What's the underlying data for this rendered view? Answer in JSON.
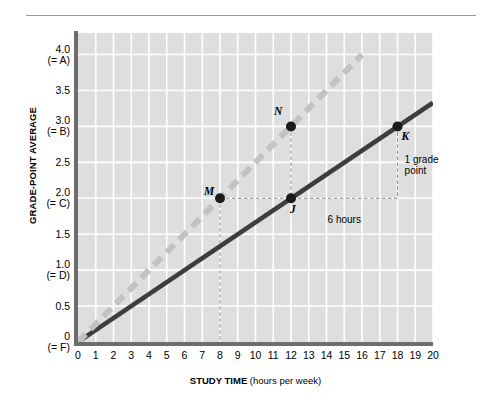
{
  "chart_data": {
    "type": "line",
    "title": "",
    "xlabel_main": "STUDY TIME",
    "xlabel_sub": "(hours per week)",
    "ylabel": "GRADE-POINT AVERAGE",
    "xlim": [
      0,
      20
    ],
    "ylim": [
      0,
      4.3
    ],
    "grid": true,
    "legend": "none",
    "x_ticks": [
      {
        "value": 0,
        "label": "0"
      },
      {
        "value": 1,
        "label": "1"
      },
      {
        "value": 2,
        "label": "2"
      },
      {
        "value": 3,
        "label": "3"
      },
      {
        "value": 4,
        "label": "4"
      },
      {
        "value": 5,
        "label": "5"
      },
      {
        "value": 6,
        "label": "6"
      },
      {
        "value": 7,
        "label": "7"
      },
      {
        "value": 8,
        "label": "8"
      },
      {
        "value": 9,
        "label": "9"
      },
      {
        "value": 10,
        "label": "10"
      },
      {
        "value": 11,
        "label": "11"
      },
      {
        "value": 12,
        "label": "12"
      },
      {
        "value": 13,
        "label": "13"
      },
      {
        "value": 14,
        "label": "14"
      },
      {
        "value": 15,
        "label": "15"
      },
      {
        "value": 16,
        "label": "16"
      },
      {
        "value": 17,
        "label": "17"
      },
      {
        "value": 18,
        "label": "18"
      },
      {
        "value": 19,
        "label": "19"
      },
      {
        "value": 20,
        "label": "20"
      }
    ],
    "y_ticks": [
      {
        "value": 4.0,
        "label": "4.0",
        "sublabel": "(= A)"
      },
      {
        "value": 3.5,
        "label": "3.5",
        "sublabel": ""
      },
      {
        "value": 3.0,
        "label": "3.0",
        "sublabel": "(= B)"
      },
      {
        "value": 2.5,
        "label": "2.5",
        "sublabel": ""
      },
      {
        "value": 2.0,
        "label": "2.0",
        "sublabel": "(= C)"
      },
      {
        "value": 1.5,
        "label": "1.5",
        "sublabel": ""
      },
      {
        "value": 1.0,
        "label": "1.0",
        "sublabel": "(= D)"
      },
      {
        "value": 0.5,
        "label": "0.5",
        "sublabel": ""
      },
      {
        "value": 0.0,
        "label": "0",
        "sublabel": "(= F)"
      }
    ],
    "series": [
      {
        "name": "solid-line",
        "style": "solid",
        "color": "#3d3d3d",
        "points": [
          [
            0,
            0
          ],
          [
            20,
            3.33
          ]
        ]
      },
      {
        "name": "dashed-line",
        "style": "dashed",
        "color": "#c2c2c2",
        "points": [
          [
            0,
            0
          ],
          [
            16,
            4.0
          ]
        ]
      }
    ],
    "data_points": [
      {
        "label": "M",
        "x": 8,
        "y": 2.0,
        "on": "dashed-line"
      },
      {
        "label": "J",
        "x": 12,
        "y": 2.0,
        "on": "solid-line"
      },
      {
        "label": "N",
        "x": 12,
        "y": 3.0,
        "on": "dashed-line"
      },
      {
        "label": "K",
        "x": 18,
        "y": 3.0,
        "on": "solid-line"
      }
    ],
    "annotations": [
      {
        "name": "run-label",
        "text": "6 hours",
        "x": 15,
        "y": 1.78
      },
      {
        "name": "rise-label",
        "text": "1 grade point",
        "x": 18.4,
        "y": 2.62
      }
    ],
    "guide_lines": [
      {
        "name": "horizontal-guide",
        "from": [
          8,
          2.0
        ],
        "to": [
          18,
          2.0
        ]
      },
      {
        "name": "vertical-guide-m",
        "from": [
          8,
          2.0
        ],
        "to": [
          8,
          0
        ]
      },
      {
        "name": "vertical-guide-n",
        "from": [
          12,
          3.0
        ],
        "to": [
          12,
          2.0
        ]
      },
      {
        "name": "vertical-guide-k",
        "from": [
          18,
          3.0
        ],
        "to": [
          18,
          2.0
        ]
      }
    ],
    "colors": {
      "panel_background": "#dedede",
      "grid_line": "#ffffff",
      "axis_line": "#6d6d6d",
      "solid_series": "#3d3d3d",
      "dashed_series": "#c2c2c2",
      "marker": "#1a1a1a",
      "guide_line": "#8c8c8c",
      "page_background": "#ffffff"
    }
  }
}
